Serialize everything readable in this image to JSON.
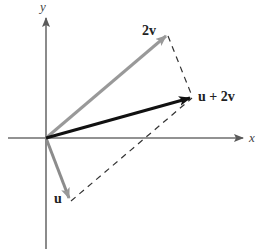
{
  "diagram": {
    "axes": {
      "x_label": "x",
      "y_label": "y",
      "color": "#6e6e6e"
    },
    "vectors": [
      {
        "name": "u",
        "label": "u",
        "color": "#8c8c8c",
        "from": [
          0,
          0
        ],
        "to": [
          0.5,
          -1.3
        ]
      },
      {
        "name": "2v",
        "label": "2v",
        "color": "#9a9a9a",
        "from": [
          0,
          0
        ],
        "to": [
          2.6,
          2.2
        ]
      },
      {
        "name": "u+2v",
        "label": "u + 2v",
        "color": "#111111",
        "from": [
          0,
          0
        ],
        "to": [
          3.1,
          0.9
        ]
      }
    ],
    "dashed_lines": [
      {
        "from": "2v",
        "to": "u+2v",
        "color": "#333333"
      },
      {
        "from": "u",
        "to": "u+2v",
        "color": "#333333"
      }
    ],
    "colors": {
      "resultant": "#111111",
      "component": "#999999",
      "axis": "#6e6e6e",
      "dash": "#333333"
    }
  }
}
